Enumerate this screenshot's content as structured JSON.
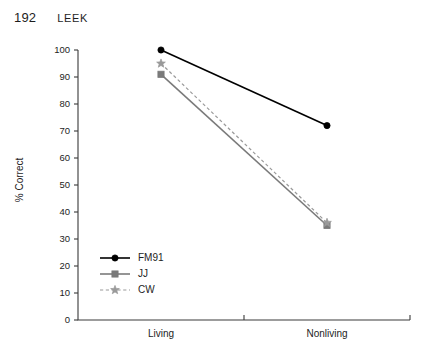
{
  "page": {
    "folio": "192",
    "running_title": "LEEK"
  },
  "chart_data": {
    "type": "line",
    "title": "",
    "xlabel": "",
    "ylabel": "% Correct",
    "categories": [
      "Living",
      "Nonliving"
    ],
    "ylim": [
      0,
      100
    ],
    "yticks": [
      0,
      10,
      20,
      30,
      40,
      50,
      60,
      70,
      80,
      90,
      100
    ],
    "ytick_labels": [
      "0",
      "10",
      "20",
      "30",
      "40",
      "50",
      "60",
      "70",
      "80",
      "90",
      "100"
    ],
    "grid": false,
    "legend_position": "lower-left-inside",
    "series": [
      {
        "name": "FM91",
        "values": [
          100,
          72
        ],
        "color": "#000000",
        "linestyle": "solid",
        "marker": "circle"
      },
      {
        "name": "JJ",
        "values": [
          91,
          35
        ],
        "color": "#7a7a7a",
        "linestyle": "solid",
        "marker": "square"
      },
      {
        "name": "CW",
        "values": [
          95,
          36
        ],
        "color": "#9a9a9a",
        "linestyle": "dashed",
        "marker": "star"
      }
    ]
  },
  "legend": {
    "entries": [
      {
        "label": "FM91"
      },
      {
        "label": "JJ"
      },
      {
        "label": "CW"
      }
    ]
  }
}
